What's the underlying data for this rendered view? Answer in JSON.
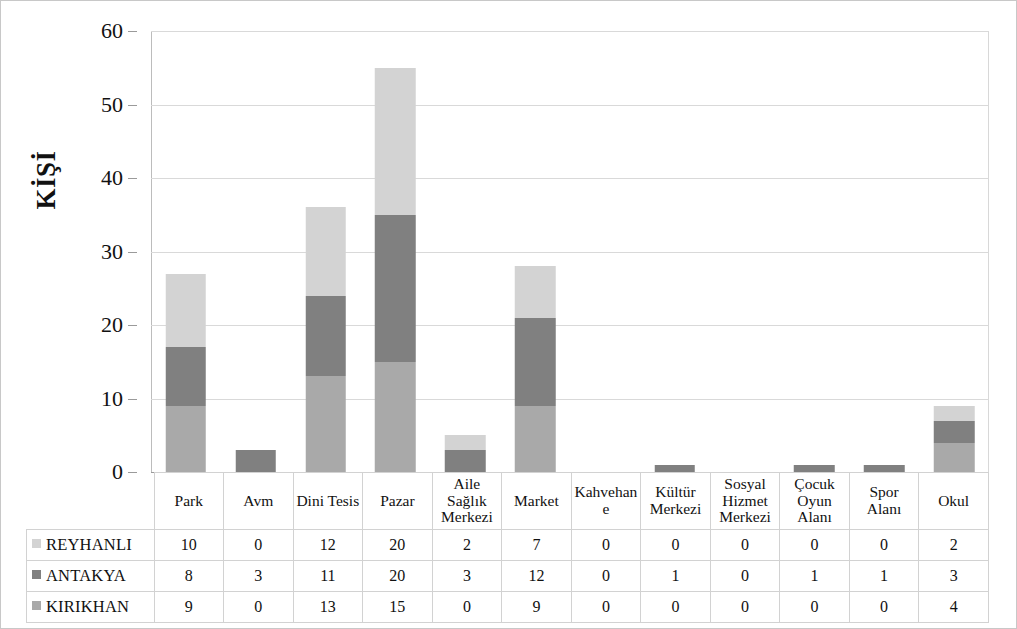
{
  "chart_data": {
    "type": "bar",
    "stacked": true,
    "title": "",
    "subtitle": "",
    "xlabel": "",
    "ylabel": "KİŞİ",
    "ylim": [
      0,
      60
    ],
    "yticks": [
      0,
      10,
      20,
      30,
      40,
      50,
      60
    ],
    "grid": true,
    "legend_position": "table-row-headers",
    "categories": [
      "Park",
      "Avm",
      "Dini Tesis",
      "Pazar",
      "Aile Sağlık Merkezi",
      "Market",
      "Kahvehan e",
      "Kültür Merkezi",
      "Sosyal Hizmet Merkezi",
      "Çocuk Oyun Alanı",
      "Spor Alanı",
      "Okul"
    ],
    "series": [
      {
        "name": "REYHANLI",
        "color": "#d3d3d3",
        "values": [
          10,
          0,
          12,
          20,
          2,
          7,
          0,
          0,
          0,
          0,
          0,
          2
        ]
      },
      {
        "name": "ANTAKYA",
        "color": "#808080",
        "values": [
          8,
          3,
          11,
          20,
          3,
          12,
          0,
          1,
          0,
          1,
          1,
          3
        ]
      },
      {
        "name": "KIRIKHAN",
        "color": "#a9a9a9",
        "values": [
          9,
          0,
          13,
          15,
          0,
          9,
          0,
          0,
          0,
          0,
          0,
          4
        ]
      }
    ],
    "stack_order_bottom_to_top": [
      "KIRIKHAN",
      "ANTAKYA",
      "REYHANLI"
    ],
    "totals": [
      27,
      3,
      36,
      55,
      5,
      28,
      0,
      1,
      0,
      1,
      1,
      9
    ]
  },
  "data_table": {
    "corner_label": "",
    "column_headers": [
      "Park",
      "Avm",
      "Dini Tesis",
      "Pazar",
      "Aile Sağlık Merkezi",
      "Market",
      "Kahvehan e",
      "Kültür Merkezi",
      "Sosyal Hizmet Merkezi",
      "Çocuk Oyun Alanı",
      "Spor Alanı",
      "Okul"
    ],
    "rows": [
      {
        "label": "REYHANLI",
        "swatch": "reyhanli",
        "values": [
          10,
          0,
          12,
          20,
          2,
          7,
          0,
          0,
          0,
          0,
          0,
          2
        ]
      },
      {
        "label": "ANTAKYA",
        "swatch": "antakya",
        "values": [
          8,
          3,
          11,
          20,
          3,
          12,
          0,
          1,
          0,
          1,
          1,
          3
        ]
      },
      {
        "label": "KIRIKHAN",
        "swatch": "kirikhan",
        "values": [
          9,
          0,
          13,
          15,
          0,
          9,
          0,
          0,
          0,
          0,
          0,
          4
        ]
      }
    ]
  },
  "colors": {
    "reyhanli": "#d3d3d3",
    "antakya": "#808080",
    "kirikhan": "#a9a9a9",
    "gridline": "#d9d9d9",
    "axis": "#9a9a9a",
    "border": "#c8c8c8"
  }
}
